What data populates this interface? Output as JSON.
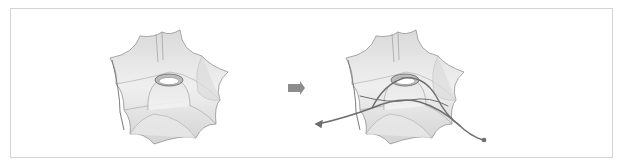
{
  "figure": {
    "panels": [
      {
        "id": "before",
        "label": "",
        "description": "translucent membrane structure with central oculus"
      },
      {
        "id": "after",
        "label": "",
        "description": "same membrane structure with curved path lines passing through"
      }
    ],
    "transition_arrow": {
      "direction": "right",
      "color": "#8c8c8c"
    },
    "colors": {
      "frame_border": "#d4d4d4",
      "membrane_fill": "#e6e6e6",
      "membrane_shade": "#c8c8c8",
      "membrane_edge": "#8a8a8a",
      "path_line": "#6e6e6e"
    }
  }
}
